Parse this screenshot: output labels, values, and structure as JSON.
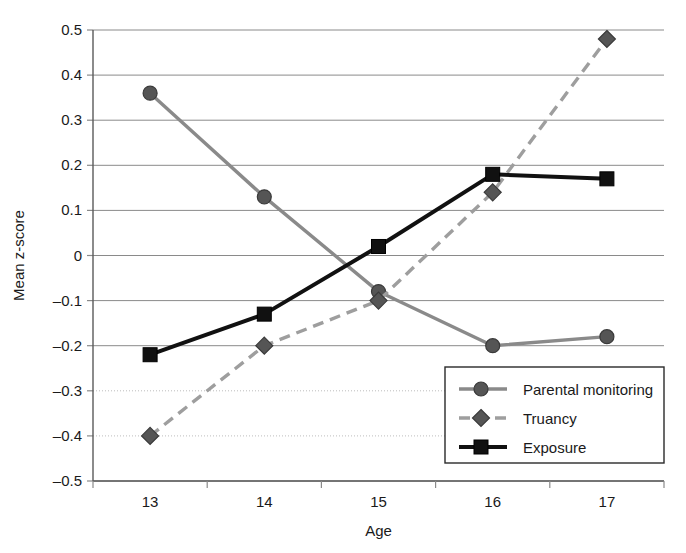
{
  "chart_data": {
    "type": "line",
    "title": "",
    "xlabel": "Age",
    "ylabel": "Mean z-score",
    "categories": [
      "13",
      "14",
      "15",
      "16",
      "17"
    ],
    "x": [
      13,
      14,
      15,
      16,
      17
    ],
    "ylim": [
      -0.5,
      0.5
    ],
    "ytick_labels": [
      "0.5",
      "0.4",
      "0.3",
      "0.2",
      "0.1",
      "0",
      "-0.1",
      "-0.2",
      "-0.3",
      "-0.4",
      "-0.5"
    ],
    "ytick_values": [
      0.5,
      0.4,
      0.3,
      0.2,
      0.1,
      0,
      -0.1,
      -0.2,
      -0.3,
      -0.4,
      -0.5
    ],
    "xtick_labels": [
      "13",
      "14",
      "15",
      "16",
      "17"
    ],
    "grid": true,
    "legend_position": "lower-right-inside",
    "series": [
      {
        "name": "Parental monitoring",
        "values": [
          0.36,
          0.13,
          -0.08,
          -0.2,
          -0.18
        ],
        "color": "#8a8a8a",
        "marker": "circle",
        "line_style": "solid"
      },
      {
        "name": "Truancy",
        "values": [
          -0.4,
          -0.2,
          -0.1,
          0.14,
          0.48
        ],
        "color": "#9e9e9e",
        "marker": "diamond",
        "line_style": "dashed"
      },
      {
        "name": "Exposure",
        "values": [
          -0.22,
          -0.13,
          0.02,
          0.18,
          0.17
        ],
        "color": "#111111",
        "marker": "square",
        "line_style": "solid"
      }
    ]
  },
  "colors": {
    "background": "#ffffff",
    "grid": "#8a8a8a",
    "axis": "#5a5a5a",
    "text": "#1a1a1a",
    "marker_fill": "#555555"
  }
}
